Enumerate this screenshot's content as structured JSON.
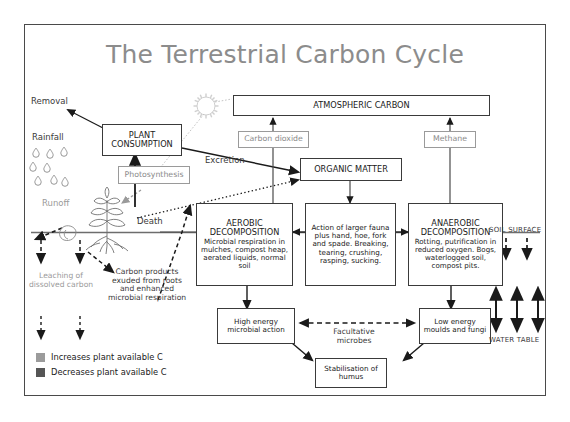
{
  "title": "The Terrestrial Carbon Cycle",
  "colors": {
    "frame": "#4a4a4a",
    "title": "#8c8c8c",
    "box_border": "#3a3a3a",
    "gray_box": "#9a9a9a",
    "legend_increase": "#9b9b9b",
    "legend_decrease": "#555555"
  },
  "boxes": {
    "atmospheric_carbon": {
      "label": "ATMOSPHERIC CARBON"
    },
    "plant_consumption": {
      "line1": "PLANT",
      "line2": "CONSUMPTION"
    },
    "organic_matter": {
      "label": "ORGANIC MATTER"
    },
    "carbon_dioxide": {
      "label": "Carbon dioxide"
    },
    "methane": {
      "label": "Methane"
    },
    "photosynthesis": {
      "label": "Photosynthesis"
    },
    "aerobic_decomposition": {
      "title_line1": "AEROBIC",
      "title_line2": "DECOMPOSITION",
      "body": "Microbial respiration in mulches, compost heap, aerated liquids, normal soil"
    },
    "fauna_action": {
      "body": "Action of larger fauna plus hand, hoe, fork and spade. Breaking, tearing, crushing, rasping, sucking."
    },
    "anaerobic_decomposition": {
      "title_line1": "ANAEROBIC",
      "title_line2": "DECOMPOSITION",
      "body": "Rotting, putrification in reduced oxygen. Bogs, waterlogged soil, compost pits."
    },
    "high_energy": {
      "body": "High energy microbial action"
    },
    "low_energy": {
      "body": "Low energy moulds and fungi"
    },
    "stabilisation": {
      "body": "Stabilisation of humus"
    }
  },
  "labels": {
    "removal": "Removal",
    "rainfall": "Rainfall",
    "runoff": "Runoff",
    "excretion": "Excretion",
    "death": "Death",
    "leaching": "Leaching of dissolved carbon",
    "carbon_products": "Carbon products exuded from roots and enhanced microbial respiration",
    "facultative": "Facultative microbes",
    "soil_surface": "SOIL SURFACE",
    "water_table": "WATER TABLE"
  },
  "legend": {
    "increase": "Increases plant available C",
    "decrease": "Decreases plant available C"
  },
  "icons": {
    "sun": "sun-icon",
    "plant": "plant-icon",
    "raindrops": "raindrop-icon"
  }
}
